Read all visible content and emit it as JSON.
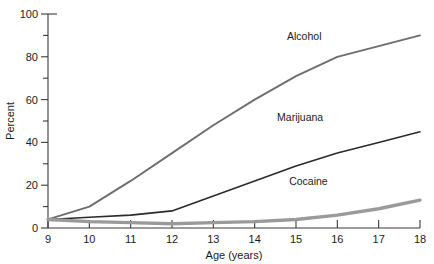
{
  "chart_data": {
    "type": "line",
    "title": "",
    "xlabel": "Age (years)",
    "ylabel": "Percent",
    "xlim": [
      9,
      18
    ],
    "ylim": [
      0,
      100
    ],
    "grid": false,
    "legend_position": "inline-labels",
    "x": [
      9,
      10,
      11,
      12,
      13,
      14,
      15,
      16,
      17,
      18
    ],
    "xticks": [
      "9",
      "10",
      "11",
      "12",
      "13",
      "14",
      "15",
      "16",
      "17",
      "18"
    ],
    "yticks": [
      "0",
      "20",
      "40",
      "60",
      "80",
      "100"
    ],
    "yticks_minor": [
      "10",
      "30",
      "50",
      "70",
      "90"
    ],
    "series": [
      {
        "name": "Alcohol",
        "color": "#6e6e6e",
        "width": 1.9,
        "label_x": 15.2,
        "label_y": 88,
        "values": [
          4,
          10,
          22,
          35,
          48,
          60,
          71,
          80,
          85,
          90
        ]
      },
      {
        "name": "Marijuana",
        "color": "#2b2b2b",
        "width": 1.6,
        "label_x": 15.1,
        "label_y": 50,
        "values": [
          4,
          5,
          6,
          8,
          15,
          22,
          29,
          35,
          40,
          45
        ]
      },
      {
        "name": "Cocaine",
        "color": "#9a9a9a",
        "width": 3.4,
        "label_x": 15.3,
        "label_y": 20,
        "values": [
          4,
          3,
          2.5,
          2,
          2.5,
          3,
          4,
          6,
          9,
          13
        ]
      }
    ]
  },
  "colors": {
    "background": "#ffffff",
    "axis": "#3a3a3a",
    "text": "#1a1a1a",
    "alcohol": "#6e6e6e",
    "marijuana": "#2b2b2b",
    "cocaine": "#9a9a9a"
  }
}
